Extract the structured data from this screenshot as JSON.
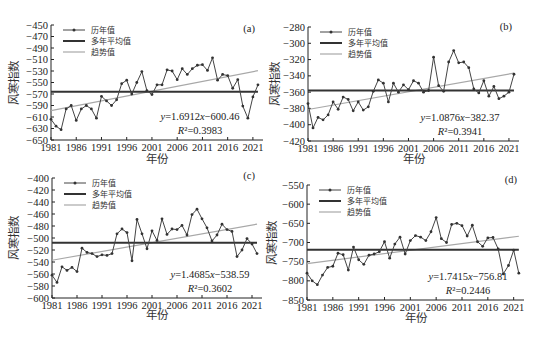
{
  "figure": {
    "xlabel": "年份",
    "ylabel": "风寒指数",
    "legend": {
      "series": "历年值",
      "mean": "多年平均值",
      "trend": "趋势值"
    }
  },
  "chart_data": [
    {
      "type": "line",
      "panel_label": "(a)",
      "xlabel": "年份",
      "ylabel": "风寒指数",
      "xticks": [
        "1981",
        "1986",
        "1991",
        "1996",
        "2001",
        "2006",
        "2011",
        "2016",
        "2021"
      ],
      "yticks": [
        -450,
        -470,
        -490,
        -510,
        -530,
        -550,
        -570,
        -590,
        -610,
        -630,
        -650
      ],
      "ylim": [
        -650,
        -450
      ],
      "legend": [
        "历年值",
        "多年平均值",
        "趋势值"
      ],
      "legend_position": "upper-left",
      "grid": false,
      "x": [
        1981,
        1982,
        1983,
        1984,
        1985,
        1986,
        1987,
        1988,
        1989,
        1990,
        1991,
        1992,
        1993,
        1994,
        1995,
        1996,
        1997,
        1998,
        1999,
        2000,
        2001,
        2002,
        2003,
        2004,
        2005,
        2006,
        2007,
        2008,
        2009,
        2010,
        2011,
        2012,
        2013,
        2014,
        2015,
        2016,
        2017,
        2018,
        2019,
        2020,
        2021,
        2022
      ],
      "series": [
        {
          "name": "历年值",
          "values": [
            -614,
            -626,
            -632,
            -596,
            -590,
            -616,
            -596,
            -590,
            -596,
            -612,
            -574,
            -582,
            -590,
            -580,
            -552,
            -546,
            -570,
            -550,
            -531,
            -564,
            -571,
            -554,
            -554,
            -528,
            -530,
            -545,
            -526,
            -536,
            -526,
            -520,
            -519,
            -529,
            -507,
            -546,
            -536,
            -538,
            -560,
            -545,
            -591,
            -612,
            -575,
            -554
          ]
        },
        {
          "name": "多年平均值",
          "values": [
            -566
          ]
        },
        {
          "name": "趋势值",
          "slope": 1.6912,
          "intercept": -600.46
        }
      ],
      "annotations": [
        "y=1.6912x-600.46",
        "R²=0.3983"
      ]
    },
    {
      "type": "line",
      "panel_label": "(b)",
      "xlabel": "年份",
      "ylabel": "风寒指数",
      "xticks": [
        "1981",
        "1986",
        "1991",
        "1996",
        "2001",
        "2006",
        "2011",
        "2016",
        "2021"
      ],
      "yticks": [
        -280,
        -300,
        -320,
        -340,
        -360,
        -380,
        -400,
        -420
      ],
      "ylim": [
        -420,
        -280
      ],
      "legend": [
        "历年值",
        "多年平均值",
        "趋势值"
      ],
      "legend_position": "upper-left",
      "grid": false,
      "x": [
        1981,
        1982,
        1983,
        1984,
        1985,
        1986,
        1987,
        1988,
        1989,
        1990,
        1991,
        1992,
        1993,
        1994,
        1995,
        1996,
        1997,
        1998,
        1999,
        2000,
        2001,
        2002,
        2003,
        2004,
        2005,
        2006,
        2007,
        2008,
        2009,
        2010,
        2011,
        2012,
        2013,
        2014,
        2015,
        2016,
        2017,
        2018,
        2019,
        2020,
        2021,
        2022
      ],
      "series": [
        {
          "name": "历年值",
          "values": [
            -374,
            -404,
            -391,
            -394,
            -388,
            -372,
            -381,
            -366,
            -369,
            -383,
            -372,
            -382,
            -378,
            -359,
            -345,
            -349,
            -372,
            -349,
            -360,
            -351,
            -357,
            -346,
            -349,
            -360,
            -358,
            -317,
            -352,
            -359,
            -323,
            -309,
            -324,
            -323,
            -330,
            -356,
            -361,
            -346,
            -365,
            -353,
            -368,
            -365,
            -360,
            -338
          ]
        },
        {
          "name": "多年平均值",
          "values": [
            -358
          ]
        },
        {
          "name": "趋势值",
          "slope": 1.0876,
          "intercept": -382.37
        }
      ],
      "annotations": [
        "y=1.0876x-382.37",
        "R²=0.3941"
      ]
    },
    {
      "type": "line",
      "panel_label": "(c)",
      "xlabel": "年份",
      "ylabel": "风寒指数",
      "xticks": [
        "1981",
        "1986",
        "1991",
        "1996",
        "2001",
        "2006",
        "2011",
        "2016",
        "2021"
      ],
      "yticks": [
        -400,
        -420,
        -440,
        -460,
        -480,
        -500,
        -520,
        -540,
        -560,
        -580,
        -600
      ],
      "ylim": [
        -600,
        -400
      ],
      "legend": [
        "历年值",
        "多年平均值",
        "趋势值"
      ],
      "legend_position": "upper-left",
      "grid": false,
      "x": [
        1981,
        1982,
        1983,
        1984,
        1985,
        1986,
        1987,
        1988,
        1989,
        1990,
        1991,
        1992,
        1993,
        1994,
        1995,
        1996,
        1997,
        1998,
        1999,
        2000,
        2001,
        2002,
        2003,
        2004,
        2005,
        2006,
        2007,
        2008,
        2009,
        2010,
        2011,
        2012,
        2013,
        2014,
        2015,
        2016,
        2017,
        2018,
        2019,
        2020,
        2021,
        2022
      ],
      "series": [
        {
          "name": "历年值",
          "values": [
            -562,
            -574,
            -548,
            -554,
            -549,
            -556,
            -517,
            -524,
            -526,
            -531,
            -528,
            -529,
            -526,
            -493,
            -485,
            -491,
            -538,
            -469,
            -493,
            -518,
            -488,
            -504,
            -468,
            -494,
            -485,
            -486,
            -479,
            -495,
            -461,
            -452,
            -468,
            -483,
            -505,
            -495,
            -477,
            -486,
            -489,
            -531,
            -520,
            -501,
            -510,
            -526
          ]
        },
        {
          "name": "多年平均值",
          "values": [
            -508
          ]
        },
        {
          "name": "趋势值",
          "slope": 1.4685,
          "intercept": -538.59
        }
      ],
      "annotations": [
        "y=1.4685x-538.59",
        "R²=0.3602"
      ]
    },
    {
      "type": "line",
      "panel_label": "(d)",
      "xlabel": "年份",
      "ylabel": "风寒指数",
      "xticks": [
        "1981",
        "1986",
        "1991",
        "1996",
        "2001",
        "2006",
        "2011",
        "2016",
        "2021"
      ],
      "yticks": [
        -550,
        -600,
        -650,
        -700,
        -750,
        -800,
        -850
      ],
      "ylim": [
        -850,
        -550
      ],
      "legend": [
        "历年值",
        "多年平均值",
        "趋势值"
      ],
      "legend_position": "upper-left",
      "grid": false,
      "x": [
        1981,
        1982,
        1983,
        1984,
        1985,
        1986,
        1987,
        1988,
        1989,
        1990,
        1991,
        1992,
        1993,
        1994,
        1995,
        1996,
        1997,
        1998,
        1999,
        2000,
        2001,
        2002,
        2003,
        2004,
        2005,
        2006,
        2007,
        2008,
        2009,
        2010,
        2011,
        2012,
        2013,
        2014,
        2015,
        2016,
        2017,
        2018,
        2019,
        2020,
        2021,
        2022
      ],
      "series": [
        {
          "name": "历年值",
          "values": [
            -780,
            -800,
            -810,
            -785,
            -765,
            -762,
            -728,
            -732,
            -772,
            -712,
            -745,
            -757,
            -733,
            -730,
            -724,
            -698,
            -741,
            -704,
            -686,
            -730,
            -695,
            -682,
            -686,
            -695,
            -672,
            -635,
            -690,
            -700,
            -653,
            -650,
            -656,
            -683,
            -655,
            -698,
            -710,
            -688,
            -687,
            -717,
            -782,
            -760,
            -720,
            -780
          ]
        },
        {
          "name": "多年平均值",
          "values": [
            -719
          ]
        },
        {
          "name": "趋势值",
          "slope": 1.7415,
          "intercept": -756.81
        }
      ],
      "annotations": [
        "y=1.7415x-756.81",
        "R²=0.2446"
      ]
    }
  ]
}
